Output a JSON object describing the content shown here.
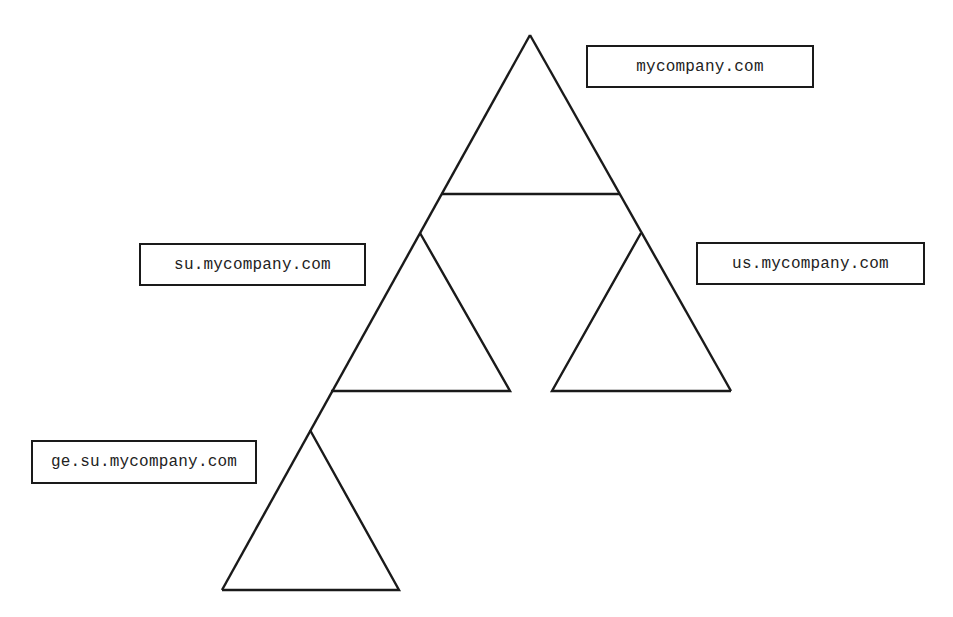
{
  "diagram": {
    "stroke_color": "#1a1a1a",
    "background": "#ffffff",
    "nodes": [
      {
        "id": "root",
        "label": "mycompany.com"
      },
      {
        "id": "su",
        "label": "su.mycompany.com"
      },
      {
        "id": "us",
        "label": "us.mycompany.com"
      },
      {
        "id": "ge",
        "label": "ge.su.mycompany.com"
      }
    ],
    "edges": [
      {
        "from": "root",
        "to": "su"
      },
      {
        "from": "root",
        "to": "us"
      },
      {
        "from": "su",
        "to": "ge"
      }
    ]
  }
}
